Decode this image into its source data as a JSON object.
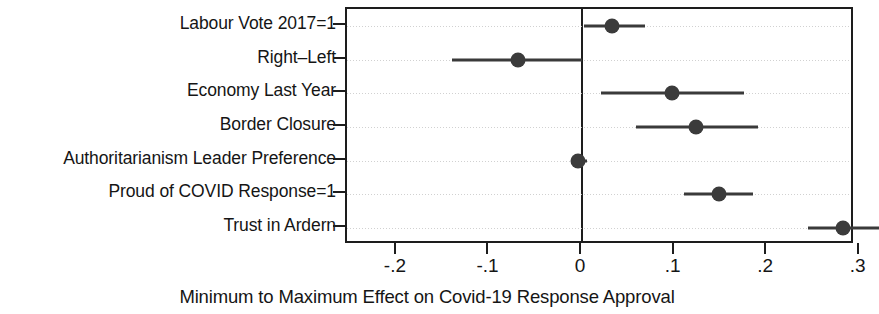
{
  "chart_data": {
    "type": "scatter",
    "subtype": "coefficient-plot",
    "title": "",
    "xlabel": "Minimum to Maximum Effect on Covid-19 Response Approval",
    "ylabel": "",
    "xlim": [
      -0.254,
      0.295
    ],
    "xticks": [
      -0.2,
      -0.1,
      0,
      0.1,
      0.2,
      0.3
    ],
    "xticklabels": [
      "-.2",
      "-.1",
      "0",
      ".1",
      ".2",
      ".3"
    ],
    "grid": true,
    "grid_orientation": "horizontal",
    "reference_line": 0,
    "legend": "none",
    "categories": [
      "Labour Vote 2017=1",
      "Right–Left",
      "Economy Last Year",
      "Border Closure",
      "Authoritarianism Leader Preference",
      "Proud of COVID Response=1",
      "Trust in Ardern"
    ],
    "points": [
      {
        "label": "Labour Vote 2017=1",
        "estimate": 0.032,
        "ci_low": 0.002,
        "ci_high": 0.068
      },
      {
        "label": "Right–Left",
        "estimate": -0.069,
        "ci_low": -0.141,
        "ci_high": 0.0
      },
      {
        "label": "Economy Last Year",
        "estimate": 0.097,
        "ci_low": 0.021,
        "ci_high": 0.175
      },
      {
        "label": "Border Closure",
        "estimate": 0.123,
        "ci_low": 0.058,
        "ci_high": 0.19
      },
      {
        "label": "Authoritarianism Leader Preference",
        "estimate": -0.004,
        "ci_low": -0.012,
        "ci_high": 0.005
      },
      {
        "label": "Proud of COVID Response=1",
        "estimate": 0.148,
        "ci_low": 0.11,
        "ci_high": 0.185
      },
      {
        "label": "Trust in Ardern",
        "estimate": 0.282,
        "ci_low": 0.244,
        "ci_high": 0.321
      }
    ],
    "marker_color": "#3b3b3b",
    "line_color": "#3a3a3a",
    "axis_color": "#1d1d1d",
    "grid_color": "#c9c9c9",
    "background_color": "#ffffff"
  }
}
